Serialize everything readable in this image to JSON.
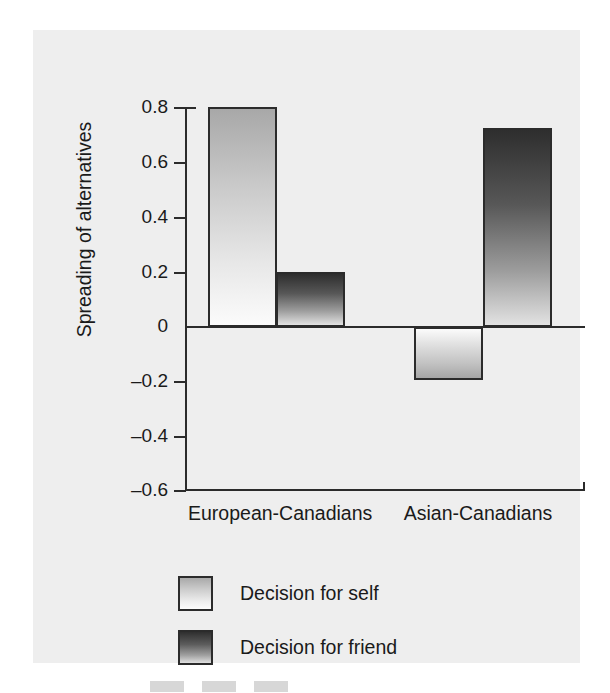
{
  "figure": {
    "background_color": "#eeeeee",
    "axis_color": "#2b2b2b"
  },
  "chart_data": {
    "type": "bar",
    "title": "",
    "xlabel": "",
    "ylabel": "Spreading of alternatives",
    "categories": [
      "European-Canadians",
      "Asian-Canadians"
    ],
    "series": [
      {
        "name": "Decision for self",
        "values": [
          0.79,
          -0.19
        ],
        "color": "#d8d8d8"
      },
      {
        "name": "Decision for friend",
        "values": [
          0.2,
          0.72
        ],
        "color": "#5a5a5a"
      }
    ],
    "ylim": [
      -0.6,
      0.8
    ],
    "ytick_labels": [
      "0.8",
      "0.6",
      "0.4",
      "0.2",
      "0",
      "–0.2",
      "–0.4",
      "–0.6"
    ],
    "ytick_values": [
      0.8,
      0.6,
      0.4,
      0.2,
      0,
      -0.2,
      -0.4,
      -0.6
    ],
    "grid": false,
    "legend_position": "bottom-left",
    "zero_baseline": true
  },
  "axis": {
    "ticks": [
      {
        "label": "0.8",
        "top": 77
      },
      {
        "label": "0.6",
        "top": 132
      },
      {
        "label": "0.4",
        "top": 187
      },
      {
        "label": "0.2",
        "top": 242
      },
      {
        "label": "0",
        "top": 296
      },
      {
        "label": "–0.2",
        "top": 351
      },
      {
        "label": "–0.4",
        "top": 406
      },
      {
        "label": "–0.6",
        "top": 460
      }
    ]
  },
  "bars": [
    {
      "name": "bar-european-canadians-self",
      "series": "self",
      "left": 175,
      "width": 69,
      "top": 77,
      "height": 220,
      "negative": false
    },
    {
      "name": "bar-european-canadians-friend",
      "series": "friend",
      "left": 243,
      "width": 69,
      "top": 242,
      "height": 55,
      "negative": false
    },
    {
      "name": "bar-asian-canadians-self",
      "series": "self",
      "left": 381,
      "width": 69,
      "top": 297,
      "height": 53,
      "negative": true
    },
    {
      "name": "bar-asian-canadians-friend",
      "series": "friend",
      "left": 450,
      "width": 69,
      "top": 98,
      "height": 199,
      "negative": false
    }
  ],
  "category_labels": [
    {
      "text": "European-Canadians",
      "left": 155,
      "width": 180
    },
    {
      "text": "Asian-Canadians",
      "left": 355,
      "width": 180
    }
  ],
  "legend": {
    "items": [
      {
        "label": "Decision for self",
        "series": "self"
      },
      {
        "label": "Decision for friend",
        "series": "friend"
      }
    ]
  }
}
